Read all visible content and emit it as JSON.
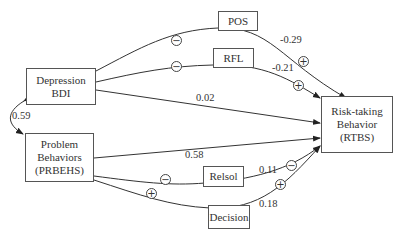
{
  "diagram": {
    "nodes": {
      "depression": {
        "line1": "Depression",
        "line2": "BDI"
      },
      "problem": {
        "line1": "Problem",
        "line2": "Behaviors",
        "line3": "(PRBEHS)"
      },
      "pos": {
        "label": "POS"
      },
      "rfl": {
        "label": "RFL"
      },
      "relsol": {
        "label": "Relsol"
      },
      "decision": {
        "label": "Decision"
      },
      "risk": {
        "line1": "Risk-taking",
        "line2": "Behavior",
        "line3": "(RTBS)"
      }
    },
    "edges": {
      "correlation": "0.59",
      "pos_to_risk": "-0.29",
      "rfl_to_risk": "-0.21",
      "depression_to_risk": "0.02",
      "problem_to_risk": "0.58",
      "relsol_to_risk": "0.11",
      "decision_to_risk": "0.18"
    },
    "signs": {
      "dep_pos": "−",
      "dep_rfl": "−",
      "pos_risk": "+",
      "rfl_risk": "+",
      "prob_relsol": "−",
      "prob_decision": "+",
      "relsol_risk": "−",
      "decision_risk": "+"
    }
  }
}
